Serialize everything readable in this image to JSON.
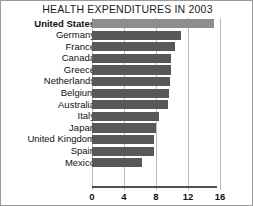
{
  "chart_data": {
    "type": "bar",
    "orientation": "horizontal",
    "title": "HEALTH EXPENDITURES IN 2003",
    "xlabel": "",
    "ylabel": "",
    "xlim": [
      0,
      18
    ],
    "xticks": [
      0,
      4,
      8,
      12,
      16
    ],
    "xtick_labels": [
      "0",
      "4",
      "8",
      "12",
      "16"
    ],
    "grid": true,
    "legend": "none",
    "highlight_category": "United States",
    "colors": {
      "bar": "#585858",
      "bar_highlight": "#8d8d8d",
      "gridline": "#b9b9b9",
      "axis": "#4f4f4f",
      "text": "#111111",
      "background": "#ffffff",
      "border": "#9a9a9a"
    },
    "categories": [
      "United States",
      "Germany",
      "France",
      "Canada",
      "Greece",
      "Netherlands",
      "Belgium",
      "Australia",
      "Italy",
      "Japan",
      "United Kingdom",
      "Spain",
      "Mexico"
    ],
    "values": [
      15.2,
      11.1,
      10.4,
      9.9,
      9.9,
      9.8,
      9.6,
      9.5,
      8.4,
      8.0,
      7.7,
      7.7,
      6.2
    ]
  }
}
